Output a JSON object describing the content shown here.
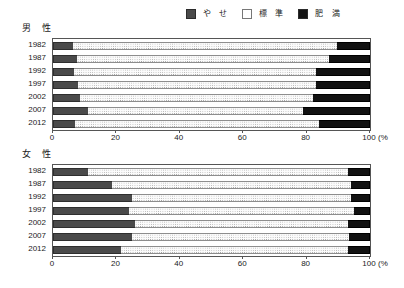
{
  "legend": {
    "entries": [
      {
        "label": "や せ",
        "swatch": "thin-swatch-icon",
        "color": "#4a4a4a"
      },
      {
        "label": "標 準",
        "swatch": "normal-swatch-icon",
        "color": "#fbfbfb"
      },
      {
        "label": "肥 満",
        "swatch": "obese-swatch-icon",
        "color": "#121212"
      }
    ]
  },
  "axis": {
    "ticks": [
      0,
      20,
      40,
      60,
      80,
      100
    ],
    "tick_labels": [
      "0",
      "20",
      "40",
      "60",
      "80",
      "100"
    ],
    "unit": "(%",
    "min": 0,
    "max": 100
  },
  "panels": [
    {
      "title": "男  性",
      "name": "male",
      "years": [
        "1982",
        "1987",
        "1992",
        "1997",
        "2002",
        "2007",
        "2012"
      ]
    },
    {
      "title": "女  性",
      "name": "female",
      "years": [
        "1982",
        "1987",
        "1992",
        "1997",
        "2002",
        "2007",
        "2012"
      ]
    }
  ],
  "chart_data": {
    "type": "bar",
    "orientation": "horizontal",
    "stacked": true,
    "normalized_percent": true,
    "title": "",
    "xlabel": "(%",
    "ylabel": "",
    "xlim": [
      0,
      100
    ],
    "grid": false,
    "legend_position": "top-right",
    "series_names": [
      "や せ",
      "標 準",
      "肥 満"
    ],
    "panels": [
      {
        "panel": "男  性",
        "categories": [
          "1982",
          "1987",
          "1992",
          "1997",
          "2002",
          "2007",
          "2012"
        ],
        "series": [
          {
            "name": "や せ",
            "values": [
              6.3,
              7.5,
              6.5,
              8.0,
              8.5,
              11.0,
              7.0
            ]
          },
          {
            "name": "標 準",
            "values": [
              83.2,
              79.5,
              76.5,
              75.0,
              73.5,
              68.0,
              77.0
            ]
          },
          {
            "name": "肥 満",
            "values": [
              10.5,
              13.0,
              17.0,
              17.0,
              18.0,
              21.0,
              16.0
            ]
          }
        ]
      },
      {
        "panel": "女  性",
        "categories": [
          "1982",
          "1987",
          "1992",
          "1997",
          "2002",
          "2007",
          "2012"
        ],
        "series": [
          {
            "name": "や せ",
            "values": [
              11.0,
              18.5,
              25.0,
              24.0,
              26.0,
              25.0,
              21.5
            ]
          },
          {
            "name": "標 準",
            "values": [
              82.0,
              75.5,
              69.0,
              71.0,
              67.0,
              68.5,
              71.5
            ]
          },
          {
            "name": "肥 満",
            "values": [
              7.0,
              6.0,
              6.0,
              5.0,
              7.0,
              6.5,
              7.0
            ]
          }
        ]
      }
    ]
  }
}
